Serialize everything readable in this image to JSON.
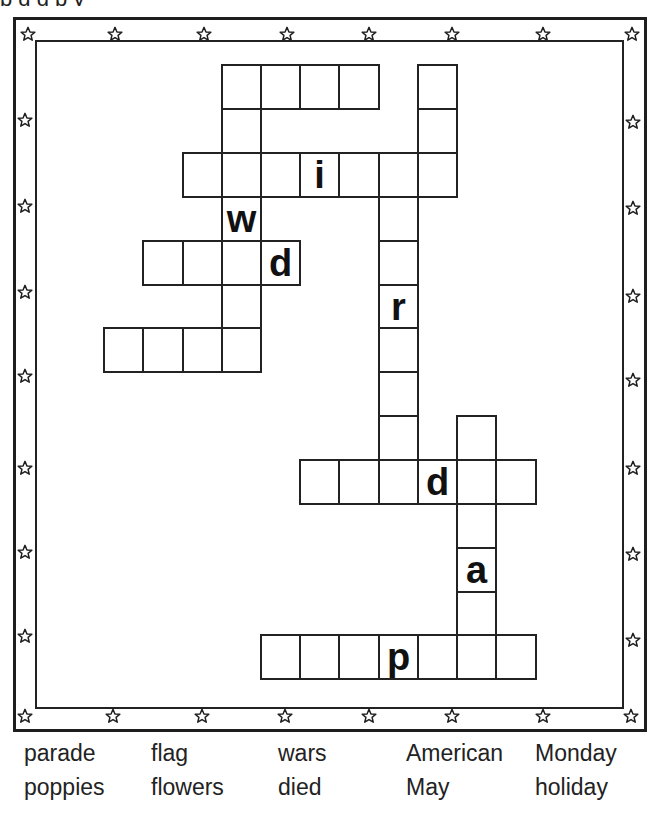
{
  "title_fragment": "p g g p y",
  "border": {
    "color": "#1e1e1e",
    "star_icon": "star-outline-icon",
    "top_stars_x": [
      28,
      115,
      204,
      287,
      369,
      452,
      543,
      632
    ],
    "bottom_stars_x": [
      25,
      113,
      202,
      285,
      369,
      452,
      543,
      631
    ],
    "left_stars_y": [
      120,
      206,
      292,
      376,
      468,
      552,
      636
    ],
    "right_stars_y": [
      122,
      208,
      296,
      380,
      468,
      554,
      640
    ]
  },
  "crossword": {
    "col_x": [
      103,
      142,
      182,
      221,
      260,
      299,
      338,
      378,
      417,
      456,
      495,
      535
    ],
    "row_y": [
      64,
      108,
      152,
      196,
      240,
      284,
      327,
      371,
      415,
      459,
      503,
      547,
      591,
      634
    ],
    "cells": [
      {
        "r": 0,
        "c": 3,
        "letter": ""
      },
      {
        "r": 0,
        "c": 4,
        "letter": ""
      },
      {
        "r": 0,
        "c": 5,
        "letter": ""
      },
      {
        "r": 0,
        "c": 6,
        "letter": ""
      },
      {
        "r": 0,
        "c": 8,
        "letter": ""
      },
      {
        "r": 1,
        "c": 3,
        "letter": ""
      },
      {
        "r": 1,
        "c": 8,
        "letter": ""
      },
      {
        "r": 2,
        "c": 2,
        "letter": ""
      },
      {
        "r": 2,
        "c": 3,
        "letter": ""
      },
      {
        "r": 2,
        "c": 4,
        "letter": ""
      },
      {
        "r": 2,
        "c": 5,
        "letter": "i"
      },
      {
        "r": 2,
        "c": 6,
        "letter": ""
      },
      {
        "r": 2,
        "c": 7,
        "letter": ""
      },
      {
        "r": 2,
        "c": 8,
        "letter": ""
      },
      {
        "r": 3,
        "c": 3,
        "letter": "w"
      },
      {
        "r": 3,
        "c": 7,
        "letter": ""
      },
      {
        "r": 4,
        "c": 1,
        "letter": ""
      },
      {
        "r": 4,
        "c": 2,
        "letter": ""
      },
      {
        "r": 4,
        "c": 3,
        "letter": ""
      },
      {
        "r": 4,
        "c": 4,
        "letter": "d"
      },
      {
        "r": 4,
        "c": 7,
        "letter": ""
      },
      {
        "r": 5,
        "c": 3,
        "letter": ""
      },
      {
        "r": 5,
        "c": 7,
        "letter": "r"
      },
      {
        "r": 6,
        "c": 0,
        "letter": ""
      },
      {
        "r": 6,
        "c": 1,
        "letter": ""
      },
      {
        "r": 6,
        "c": 2,
        "letter": ""
      },
      {
        "r": 6,
        "c": 3,
        "letter": ""
      },
      {
        "r": 6,
        "c": 7,
        "letter": ""
      },
      {
        "r": 7,
        "c": 7,
        "letter": ""
      },
      {
        "r": 8,
        "c": 7,
        "letter": ""
      },
      {
        "r": 8,
        "c": 9,
        "letter": ""
      },
      {
        "r": 9,
        "c": 5,
        "letter": ""
      },
      {
        "r": 9,
        "c": 6,
        "letter": ""
      },
      {
        "r": 9,
        "c": 7,
        "letter": ""
      },
      {
        "r": 9,
        "c": 8,
        "letter": "d"
      },
      {
        "r": 9,
        "c": 9,
        "letter": ""
      },
      {
        "r": 9,
        "c": 10,
        "letter": ""
      },
      {
        "r": 10,
        "c": 9,
        "letter": ""
      },
      {
        "r": 11,
        "c": 9,
        "letter": "a"
      },
      {
        "r": 12,
        "c": 9,
        "letter": ""
      },
      {
        "r": 13,
        "c": 4,
        "letter": ""
      },
      {
        "r": 13,
        "c": 5,
        "letter": ""
      },
      {
        "r": 13,
        "c": 6,
        "letter": ""
      },
      {
        "r": 13,
        "c": 7,
        "letter": "p"
      },
      {
        "r": 13,
        "c": 8,
        "letter": ""
      },
      {
        "r": 13,
        "c": 9,
        "letter": ""
      },
      {
        "r": 13,
        "c": 10,
        "letter": ""
      }
    ]
  },
  "word_bank": {
    "columns": [
      {
        "x": 24,
        "words": [
          "parade",
          "poppies"
        ]
      },
      {
        "x": 151,
        "words": [
          "flag",
          "flowers"
        ]
      },
      {
        "x": 278,
        "words": [
          "wars",
          "died"
        ]
      },
      {
        "x": 406,
        "words": [
          "American",
          "May"
        ]
      },
      {
        "x": 535,
        "words": [
          "Monday",
          "holiday"
        ]
      }
    ]
  }
}
